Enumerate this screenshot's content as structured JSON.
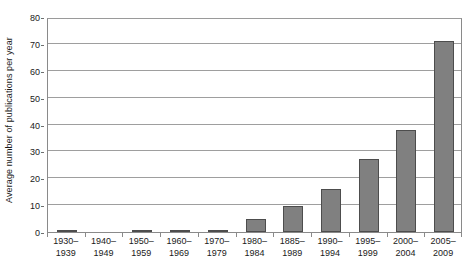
{
  "chart_data": {
    "type": "bar",
    "title": "",
    "subtitle": "",
    "xlabel": "",
    "ylabel": "Average number of publications per year",
    "ylim": [
      0,
      80
    ],
    "ytick_values": [
      0,
      10,
      20,
      30,
      40,
      50,
      60,
      70,
      80
    ],
    "ytick_labels": [
      "0",
      "10",
      "20",
      "30",
      "40",
      "50",
      "60",
      "70",
      "80"
    ],
    "grid": "horizontal",
    "legend": "none",
    "bar_color": "#808080",
    "bar_edge_color": "#4d4d4d",
    "categories": [
      "1930–1939",
      "1940–1949",
      "1950–1959",
      "1960–1969",
      "1970–1979",
      "1980–1984",
      "1885–1989",
      "1990–1994",
      "1995–1999",
      "2000–2004",
      "2005–2009"
    ],
    "category_lines": [
      [
        "1930–",
        "1939"
      ],
      [
        "1940–",
        "1949"
      ],
      [
        "1950–",
        "1959"
      ],
      [
        "1960–",
        "1969"
      ],
      [
        "1970–",
        "1979"
      ],
      [
        "1980–",
        "1984"
      ],
      [
        "1885–",
        "1989"
      ],
      [
        "1990–",
        "1994"
      ],
      [
        "1995–",
        "1999"
      ],
      [
        "2000–",
        "2004"
      ],
      [
        "2005–",
        "2009"
      ]
    ],
    "values": [
      0.3,
      0,
      0.8,
      0.3,
      0.1,
      5,
      9.5,
      16,
      27,
      38,
      71
    ]
  }
}
